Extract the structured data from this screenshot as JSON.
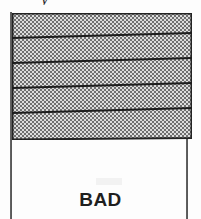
{
  "figure": {
    "caption": "BAD",
    "top_glyph_fragment": "y",
    "colors": {
      "ink": "#1f1f1f",
      "border": "#232323",
      "stripe_line": "#1c1c1c",
      "hatch_dark": "#6b6b6b",
      "hatch_light": "#d8d8d8",
      "pole": "#4a4a4a",
      "paper": "#fdfdfd"
    },
    "flag": {
      "label": "flag-banner",
      "left": 12,
      "top": 13,
      "width": 180,
      "height": 127,
      "fill_pattern": "checkerboard-dither",
      "border_width": 2,
      "stripe_count": 5,
      "stripe_lines": [
        {
          "x1": 0,
          "y1": 25,
          "x2": 180,
          "y2": 20
        },
        {
          "x1": 0,
          "y1": 50,
          "x2": 180,
          "y2": 45
        },
        {
          "x1": 0,
          "y1": 75,
          "x2": 180,
          "y2": 70
        },
        {
          "x1": 0,
          "y1": 100,
          "x2": 180,
          "y2": 95
        }
      ]
    },
    "poles": [
      {
        "name": "left-pole",
        "left": 10,
        "top": 12,
        "height": 207
      },
      {
        "name": "right-pole",
        "left": 186,
        "top": 136,
        "height": 83
      }
    ]
  }
}
